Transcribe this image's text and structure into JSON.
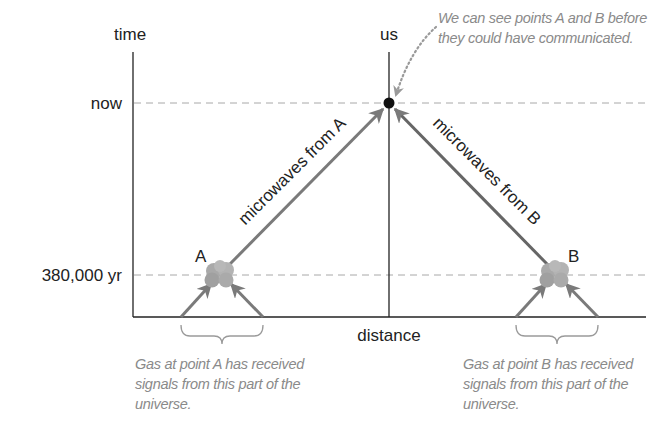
{
  "diagram": {
    "axes": {
      "y_label": "time",
      "x_label": "distance",
      "ticks": [
        {
          "label": "now",
          "level": "now"
        },
        {
          "label": "380,000 yr",
          "level": "recombination"
        }
      ]
    },
    "observer": {
      "label": "us"
    },
    "points": [
      {
        "id": "A",
        "label": "A",
        "arrow_label": "microwaves from A",
        "note": "Gas at point A has received signals from this part of the universe."
      },
      {
        "id": "B",
        "label": "B",
        "arrow_label": "microwaves from B",
        "note": "Gas at point B has received signals from this part of the universe."
      }
    ],
    "annotation": "We can see points A and B before they could have communicated.",
    "colors": {
      "axis": "#222222",
      "dashed_line": "#a8a8a8",
      "arrow": "#7a7a7a",
      "cloud": "#a9a9a9",
      "note_text": "#8a8a8a",
      "observer_dot": "#111111"
    }
  }
}
